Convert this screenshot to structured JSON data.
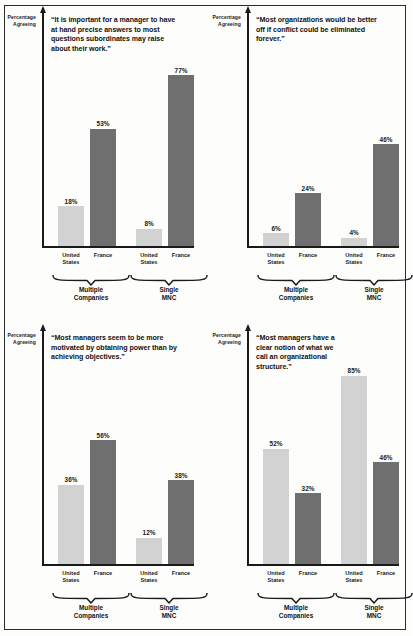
{
  "figure": {
    "axis_caption_line1": "Percentage",
    "axis_caption_line2": "Agreeing",
    "bar_light_color": "#d2d2d2",
    "bar_dark_color": "#6f6f6f"
  },
  "chart_data": [
    {
      "type": "bar",
      "title": "“It is important for a manager to have at hand precise answers to most questions subordinates may raise about their work.”",
      "ylabel": "Percentage Agreeing",
      "xlabel": "",
      "ylim": [
        0,
        100
      ],
      "grid": false,
      "legend": "none",
      "groups": [
        "Multiple Companies",
        "Single MNC"
      ],
      "categories": [
        "United States",
        "France"
      ],
      "series": [
        {
          "name": "Multiple Companies",
          "values": [
            18,
            53
          ],
          "labels": [
            "18%",
            "53%"
          ]
        },
        {
          "name": "Single MNC",
          "values": [
            8,
            77
          ],
          "labels": [
            "8%",
            "77%"
          ]
        }
      ]
    },
    {
      "type": "bar",
      "title": "“Most organizations would be better off if conflict could be eliminated forever.”",
      "ylabel": "Percentage Agreeing",
      "xlabel": "",
      "ylim": [
        0,
        100
      ],
      "grid": false,
      "legend": "none",
      "groups": [
        "Multiple Companies",
        "Single MNC"
      ],
      "categories": [
        "United States",
        "France"
      ],
      "series": [
        {
          "name": "Multiple Companies",
          "values": [
            6,
            24
          ],
          "labels": [
            "6%",
            "24%"
          ]
        },
        {
          "name": "Single MNC",
          "values": [
            4,
            46
          ],
          "labels": [
            "4%",
            "46%"
          ]
        }
      ]
    },
    {
      "type": "bar",
      "title": "“Most managers seem to be more motivated by obtaining power than by achieving objectives.”",
      "ylabel": "Percentage Agreeing",
      "xlabel": "",
      "ylim": [
        0,
        100
      ],
      "grid": false,
      "legend": "none",
      "groups": [
        "Multiple Companies",
        "Single MNC"
      ],
      "categories": [
        "United States",
        "France"
      ],
      "series": [
        {
          "name": "Multiple Companies",
          "values": [
            36,
            56
          ],
          "labels": [
            "36%",
            "56%"
          ]
        },
        {
          "name": "Single MNC",
          "values": [
            12,
            38
          ],
          "labels": [
            "12%",
            "38%"
          ]
        }
      ]
    },
    {
      "type": "bar",
      "title": "“Most managers have a clear notion of what we call an organizational structure.”",
      "ylabel": "Percentage Agreeing",
      "xlabel": "",
      "ylim": [
        0,
        100
      ],
      "grid": false,
      "legend": "none",
      "groups": [
        "Multiple Companies",
        "Single MNC"
      ],
      "categories": [
        "United States",
        "France"
      ],
      "series": [
        {
          "name": "Multiple Companies",
          "values": [
            52,
            32
          ],
          "labels": [
            "52%",
            "32%"
          ]
        },
        {
          "name": "Single MNC",
          "values": [
            85,
            46
          ],
          "labels": [
            "85%",
            "46%"
          ]
        }
      ]
    }
  ],
  "panels": [
    {
      "quote": "“It is important for a manager to have at hand precise answers to most questions subordinates may raise about their work.”",
      "bars": [
        {
          "label": "18%",
          "cat_l1": "United",
          "cat_l2": "States",
          "tone": "light"
        },
        {
          "label": "53%",
          "cat_l1": "France",
          "cat_l2": "",
          "tone": "dark"
        },
        {
          "label": "8%",
          "cat_l1": "United",
          "cat_l2": "States",
          "tone": "light"
        },
        {
          "label": "77%",
          "cat_l1": "France",
          "cat_l2": "",
          "tone": "dark"
        }
      ],
      "groups": [
        {
          "l1": "Multiple",
          "l2": "Companies"
        },
        {
          "l1": "Single",
          "l2": "MNC"
        }
      ]
    },
    {
      "quote": "“Most organizations would be better off if conflict could be eliminated forever.”",
      "bars": [
        {
          "label": "6%",
          "cat_l1": "United",
          "cat_l2": "States",
          "tone": "light"
        },
        {
          "label": "24%",
          "cat_l1": "France",
          "cat_l2": "",
          "tone": "dark"
        },
        {
          "label": "4%",
          "cat_l1": "United",
          "cat_l2": "States",
          "tone": "light"
        },
        {
          "label": "46%",
          "cat_l1": "France",
          "cat_l2": "",
          "tone": "dark"
        }
      ],
      "groups": [
        {
          "l1": "Multiple",
          "l2": "Companies"
        },
        {
          "l1": "Single",
          "l2": "MNC"
        }
      ]
    },
    {
      "quote": "“Most managers seem to be more motivated by obtaining power than by achieving objectives.”",
      "bars": [
        {
          "label": "36%",
          "cat_l1": "United",
          "cat_l2": "States",
          "tone": "light"
        },
        {
          "label": "56%",
          "cat_l1": "France",
          "cat_l2": "",
          "tone": "dark"
        },
        {
          "label": "12%",
          "cat_l1": "United",
          "cat_l2": "States",
          "tone": "light"
        },
        {
          "label": "38%",
          "cat_l1": "France",
          "cat_l2": "",
          "tone": "dark"
        }
      ],
      "groups": [
        {
          "l1": "Multiple",
          "l2": "Companies"
        },
        {
          "l1": "Single",
          "l2": "MNC"
        }
      ]
    },
    {
      "quote": "“Most managers have a clear notion of what we call an organizational structure.”",
      "bars": [
        {
          "label": "52%",
          "cat_l1": "United",
          "cat_l2": "States",
          "tone": "light"
        },
        {
          "label": "32%",
          "cat_l1": "France",
          "cat_l2": "",
          "tone": "dark"
        },
        {
          "label": "85%",
          "cat_l1": "United",
          "cat_l2": "States",
          "tone": "light"
        },
        {
          "label": "46%",
          "cat_l1": "France",
          "cat_l2": "",
          "tone": "dark"
        }
      ],
      "groups": [
        {
          "l1": "Multiple",
          "l2": "Companies"
        },
        {
          "l1": "Single",
          "l2": "MNC"
        }
      ]
    }
  ]
}
